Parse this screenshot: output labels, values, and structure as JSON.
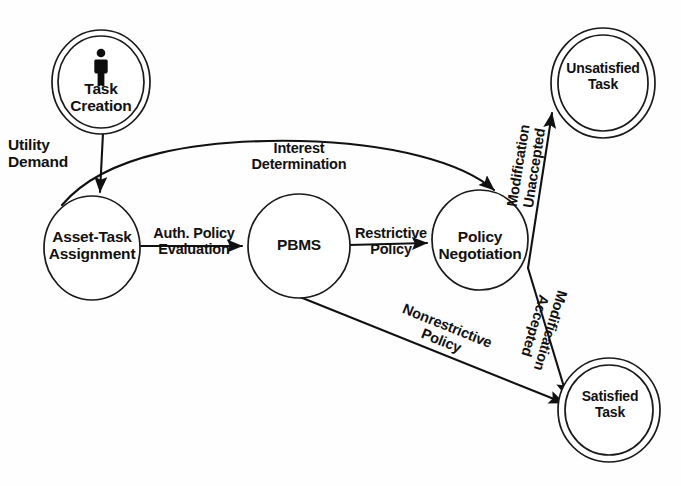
{
  "diagram": {
    "stroke_color": "#111111",
    "background_color": "#ffffff",
    "nodes": [
      {
        "id": "task-creation",
        "label_line1": "Task",
        "label_line2": "Creation",
        "shape": "double-circle",
        "icon": "person-icon"
      },
      {
        "id": "asset-task-assignment",
        "label_line1": "Asset-Task",
        "label_line2": "Assignment",
        "shape": "circle"
      },
      {
        "id": "pbms",
        "label_line1": "PBMS",
        "label_line2": "",
        "shape": "circle"
      },
      {
        "id": "policy-negotiation",
        "label_line1": "Policy",
        "label_line2": "Negotiation",
        "shape": "circle"
      },
      {
        "id": "unsatisfied-task",
        "label_line1": "Unsatisfied",
        "label_line2": "Task",
        "shape": "double-circle"
      },
      {
        "id": "satisfied-task",
        "label_line1": "Satisfied",
        "label_line2": "Task",
        "shape": "double-circle"
      }
    ],
    "edges": [
      {
        "id": "utility-demand",
        "from": "task-creation",
        "to": "asset-task-assignment",
        "label_line1": "Utility",
        "label_line2": "Demand"
      },
      {
        "id": "interest-determination",
        "from": "asset-task-assignment",
        "to": "policy-negotiation",
        "label_line1": "Interest",
        "label_line2": "Determination"
      },
      {
        "id": "auth-policy-evaluation",
        "from": "asset-task-assignment",
        "to": "pbms",
        "label_line1": "Auth. Policy",
        "label_line2": "Evaluation"
      },
      {
        "id": "restrictive-policy",
        "from": "pbms",
        "to": "policy-negotiation",
        "label_line1": "Restrictive",
        "label_line2": "Policy"
      },
      {
        "id": "modification-unaccepted",
        "from": "policy-negotiation",
        "to": "unsatisfied-task",
        "label_line1": "Modification",
        "label_line2": "Unaccepted"
      },
      {
        "id": "modification-accepted",
        "from": "policy-negotiation",
        "to": "satisfied-task",
        "label_line1": "Modification",
        "label_line2": "Accepted"
      },
      {
        "id": "nonrestrictive-policy",
        "from": "pbms",
        "to": "satisfied-task",
        "label_line1": "Nonrestrictive",
        "label_line2": "Policy"
      }
    ]
  }
}
